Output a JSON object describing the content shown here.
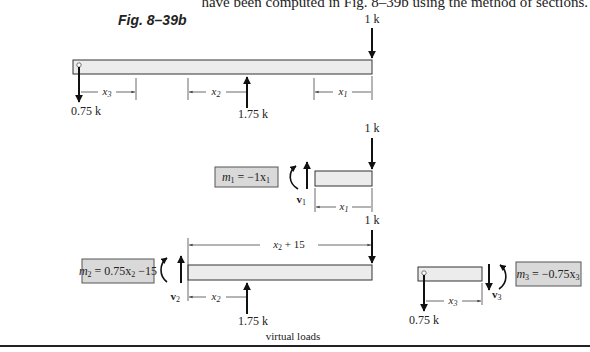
{
  "header": {
    "body_text_fragment": "have been computed in Fig. 8–39b using the method of sections.",
    "figure_label": "Fig. 8–39b"
  },
  "full_beam": {
    "load_top": "1 k",
    "reaction_left": "0.75 k",
    "reaction_mid": "1.75 k",
    "dim_x3": "x",
    "dim_x3_sub": "3",
    "dim_x2": "x",
    "dim_x2_sub": "2",
    "dim_x1": "x",
    "dim_x1_sub": "1"
  },
  "section_1": {
    "load_top": "1 k",
    "moment_label": "m",
    "moment_sub": "1",
    "moment_expr": " = −1x",
    "moment_expr_sub": "1",
    "shear_label": "v",
    "shear_sub": "1",
    "dim_x": "x",
    "dim_x_sub": "1"
  },
  "section_2": {
    "load_top": "1 k",
    "moment_label": "m",
    "moment_sub": "2",
    "moment_expr": " = 0.75x",
    "moment_expr_sub": "2",
    "moment_expr_tail": " −15",
    "shear_label": "v",
    "shear_sub": "2",
    "dim_top": "x",
    "dim_top_sub": "2",
    "dim_top_tail": " + 15",
    "dim_x": "x",
    "dim_x_sub": "2",
    "reaction": "1.75 k"
  },
  "section_3": {
    "moment_label": "m",
    "moment_sub": "3",
    "moment_expr": " = −0.75x",
    "moment_expr_sub": "3",
    "shear_label": "v",
    "shear_sub": "3",
    "dim_x": "x",
    "dim_x_sub": "3",
    "reaction": "0.75 k"
  },
  "footer": {
    "caption": "virtual loads"
  }
}
